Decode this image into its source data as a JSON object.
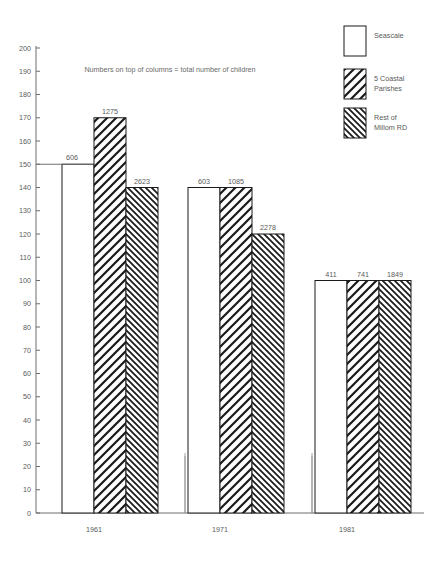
{
  "chart_data": {
    "type": "bar",
    "title": "",
    "subtitle": "Numbers on top of columns  =  total number of children",
    "xlabel": "",
    "ylabel": "",
    "categories": [
      "1961",
      "1971",
      "1981"
    ],
    "ylim": [
      0,
      200
    ],
    "ytick_step": 10,
    "yticks": [
      "0",
      "10",
      "20",
      "30",
      "40",
      "50",
      "60",
      "70",
      "80",
      "90",
      "100",
      "110",
      "120",
      "130",
      "140",
      "150",
      "160",
      "170",
      "180",
      "190",
      "200"
    ],
    "grid": false,
    "legend_position": "top-right",
    "series": [
      {
        "name": "Seascale",
        "pattern": "solid-white",
        "values": [
          150,
          140,
          100
        ],
        "labels": [
          "606",
          "603",
          "411"
        ]
      },
      {
        "name": "5 Coastal Parishes",
        "pattern": "hatch-backslash",
        "values": [
          170,
          140,
          100
        ],
        "labels": [
          "1275",
          "1085",
          "741"
        ]
      },
      {
        "name": "Rest of Millom RD",
        "pattern": "hatch-slash",
        "values": [
          140,
          120,
          100
        ],
        "labels": [
          "2623",
          "2278",
          "1849"
        ]
      }
    ]
  },
  "legend": {
    "items": [
      {
        "label": "Seascale",
        "line2": ""
      },
      {
        "label": "5 Coastal",
        "line2": "Parishes"
      },
      {
        "label": "Rest of",
        "line2": "Millom RD"
      }
    ]
  },
  "colors": {
    "axis": "#6d6d6d",
    "text": "#5a5a5a",
    "bar_outline": "#1a1a1a",
    "background": "#ffffff"
  }
}
